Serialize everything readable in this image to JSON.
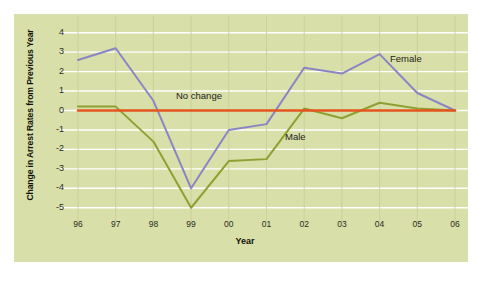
{
  "chart_data": {
    "type": "line",
    "title": "",
    "subtitle": "",
    "xlabel": "Year",
    "ylabel": "Change in Arrest Rates from Previous Year",
    "categories": [
      "96",
      "97",
      "98",
      "99",
      "00",
      "01",
      "02",
      "03",
      "04",
      "05",
      "06"
    ],
    "x_tick_labels": [
      "96",
      "97",
      "98",
      "99",
      "00",
      "01",
      "02",
      "03",
      "04",
      "05",
      "06"
    ],
    "y_tick_labels": [
      "4",
      "3",
      "2",
      "1",
      "0",
      "-1",
      "-2",
      "-3",
      "-4",
      "-5"
    ],
    "ylim": [
      -5.6,
      4.6
    ],
    "xlim": [
      95.6,
      106.4
    ],
    "grid": "horizontal",
    "grid_color": "#ffffff",
    "legend_position": "inline-annotations",
    "plot_background": "#d8dfa8",
    "page_background": "#ffffff",
    "series": [
      {
        "name": "Female",
        "color": "#8a85c4",
        "values": [
          2.6,
          3.2,
          0.5,
          -4.0,
          -1.0,
          -0.7,
          2.2,
          1.9,
          2.9,
          0.9,
          0.0
        ]
      },
      {
        "name": "Male",
        "color": "#8fa032",
        "values": [
          0.2,
          0.2,
          -1.6,
          -5.0,
          -2.6,
          -2.5,
          0.1,
          -0.4,
          0.4,
          0.1,
          0.0
        ]
      },
      {
        "name": "No change",
        "color": "#e2561e",
        "values": [
          0,
          0,
          0,
          0,
          0,
          0,
          0,
          0,
          0,
          0,
          0
        ]
      }
    ],
    "annotations": [
      {
        "text": "No change",
        "series": "No change",
        "color": "#23231a"
      },
      {
        "text": "Female",
        "series": "Female",
        "color": "#23231a"
      },
      {
        "text": "Male",
        "series": "Male",
        "color": "#23231a"
      }
    ]
  }
}
